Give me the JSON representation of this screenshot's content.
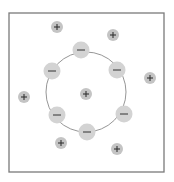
{
  "diagram": {
    "title": "",
    "frame": {
      "x": 9,
      "y": 13,
      "width": 155,
      "height": 159,
      "stroke": "#7a7a7a"
    },
    "ring": {
      "cx": 86,
      "cy": 92,
      "r": 40,
      "stroke": "#8a8a8a"
    },
    "colors": {
      "anion_fill": "#d3d3d3",
      "cation_fill": "#c4c4c4",
      "symbol": "#333333"
    },
    "anions": [
      {
        "label": "−",
        "cx": 81,
        "cy": 50,
        "r": 8.5
      },
      {
        "label": "−",
        "cx": 117,
        "cy": 70,
        "r": 8.5
      },
      {
        "label": "−",
        "cx": 124,
        "cy": 114,
        "r": 8.5
      },
      {
        "label": "−",
        "cx": 87,
        "cy": 132,
        "r": 8.5
      },
      {
        "label": "−",
        "cx": 57,
        "cy": 115,
        "r": 8.5
      },
      {
        "label": "−",
        "cx": 52,
        "cy": 71,
        "r": 8.5
      }
    ],
    "cations": [
      {
        "label": "+",
        "cx": 86,
        "cy": 94,
        "r": 6
      },
      {
        "label": "+",
        "cx": 57,
        "cy": 27,
        "r": 6
      },
      {
        "label": "+",
        "cx": 113,
        "cy": 35,
        "r": 6
      },
      {
        "label": "+",
        "cx": 150,
        "cy": 78,
        "r": 6
      },
      {
        "label": "+",
        "cx": 24,
        "cy": 97,
        "r": 6
      },
      {
        "label": "+",
        "cx": 61,
        "cy": 143,
        "r": 6
      },
      {
        "label": "+",
        "cx": 117,
        "cy": 149,
        "r": 6
      }
    ]
  }
}
